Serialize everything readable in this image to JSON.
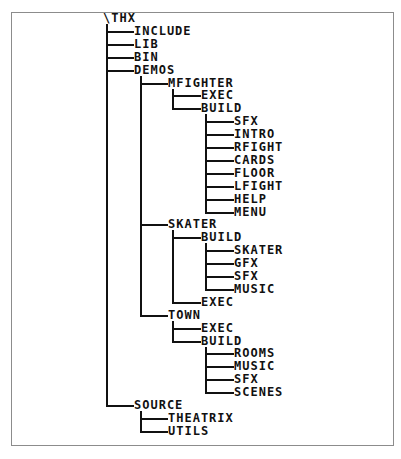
{
  "diagram": {
    "type": "directory-tree",
    "root": "\\THX",
    "rows": [
      {
        "label": "\\THX",
        "depth": 0
      },
      {
        "label": "INCLUDE",
        "depth": 1
      },
      {
        "label": "LIB",
        "depth": 1
      },
      {
        "label": "BIN",
        "depth": 1
      },
      {
        "label": "DEMOS",
        "depth": 1
      },
      {
        "label": "MFIGHTER",
        "depth": 2
      },
      {
        "label": "EXEC",
        "depth": 3
      },
      {
        "label": "BUILD",
        "depth": 3
      },
      {
        "label": "SFX",
        "depth": 4
      },
      {
        "label": "INTRO",
        "depth": 4
      },
      {
        "label": "RFIGHT",
        "depth": 4
      },
      {
        "label": "CARDS",
        "depth": 4
      },
      {
        "label": "FLOOR",
        "depth": 4
      },
      {
        "label": "LFIGHT",
        "depth": 4
      },
      {
        "label": "HELP",
        "depth": 4
      },
      {
        "label": "MENU",
        "depth": 4
      },
      {
        "label": "SKATER",
        "depth": 2
      },
      {
        "label": "BUILD",
        "depth": 3
      },
      {
        "label": "SKATER",
        "depth": 4
      },
      {
        "label": "GFX",
        "depth": 4
      },
      {
        "label": "SFX",
        "depth": 4
      },
      {
        "label": "MUSIC",
        "depth": 4
      },
      {
        "label": "EXEC",
        "depth": 3
      },
      {
        "label": "TOWN",
        "depth": 2
      },
      {
        "label": "EXEC",
        "depth": 3
      },
      {
        "label": "BUILD",
        "depth": 3
      },
      {
        "label": "ROOMS",
        "depth": 4
      },
      {
        "label": "MUSIC",
        "depth": 4
      },
      {
        "label": "SFX",
        "depth": 4
      },
      {
        "label": "SCENES",
        "depth": 4
      },
      {
        "label": "SOURCE",
        "depth": 1
      },
      {
        "label": "THEATRIX",
        "depth": 2
      },
      {
        "label": "UTILS",
        "depth": 2
      }
    ]
  },
  "colors": {
    "line": "#111111",
    "text": "#111111",
    "frame": "#8c8c8c",
    "background": "#ffffff"
  }
}
